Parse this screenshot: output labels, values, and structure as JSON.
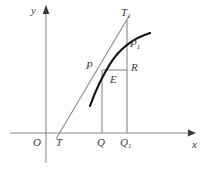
{
  "figure": {
    "type": "geometry-diagram",
    "axes": {
      "x_axis_label": "x",
      "y_axis_label": "y",
      "origin_label": "O",
      "x_axis_y": 133,
      "y_axis_x": 46,
      "x_axis_arrow": true,
      "y_axis_arrow": true,
      "axis_color": "#8a8a8a"
    },
    "points": [
      {
        "name": "O",
        "label": "O",
        "sub": "",
        "x": 46,
        "y": 133
      },
      {
        "name": "T",
        "label": "T",
        "sub": "",
        "x": 60,
        "y": 133
      },
      {
        "name": "Q",
        "label": "Q",
        "sub": "",
        "x": 102,
        "y": 133
      },
      {
        "name": "Q1",
        "label": "Q",
        "sub": "1",
        "x": 127,
        "y": 133
      },
      {
        "name": "P",
        "label": "P",
        "sub": "",
        "x": 102,
        "y": 70
      },
      {
        "name": "P1",
        "label": "P",
        "sub": "1",
        "x": 127,
        "y": 46
      },
      {
        "name": "T1",
        "label": "T",
        "sub": "1",
        "x": 127,
        "y": 20
      },
      {
        "name": "R",
        "label": "R",
        "sub": "",
        "x": 127,
        "y": 70
      },
      {
        "name": "E",
        "label": "E",
        "sub": "",
        "x": 113,
        "y": 80
      }
    ],
    "curve": {
      "name": "function-curve",
      "color": "#111111",
      "width": 2.2,
      "path": "M 90,106 C 95,92 100,80 110,64 C 120,48 134,38 150,33"
    },
    "tangent_line": {
      "name": "tangent-line-T-T1",
      "from": "T",
      "to": "T1",
      "color": "#8a8a8a",
      "width": 1
    },
    "segments": [
      {
        "name": "ordinate-PQ",
        "x1": 102,
        "y1": 70,
        "x2": 102,
        "y2": 133
      },
      {
        "name": "ordinate-T1Q1",
        "x1": 127,
        "y1": 20,
        "x2": 127,
        "y2": 133
      },
      {
        "name": "horizontal-PR",
        "x1": 102,
        "y1": 70,
        "x2": 127,
        "y2": 70
      }
    ],
    "segment_color": "#8a8a8a"
  }
}
